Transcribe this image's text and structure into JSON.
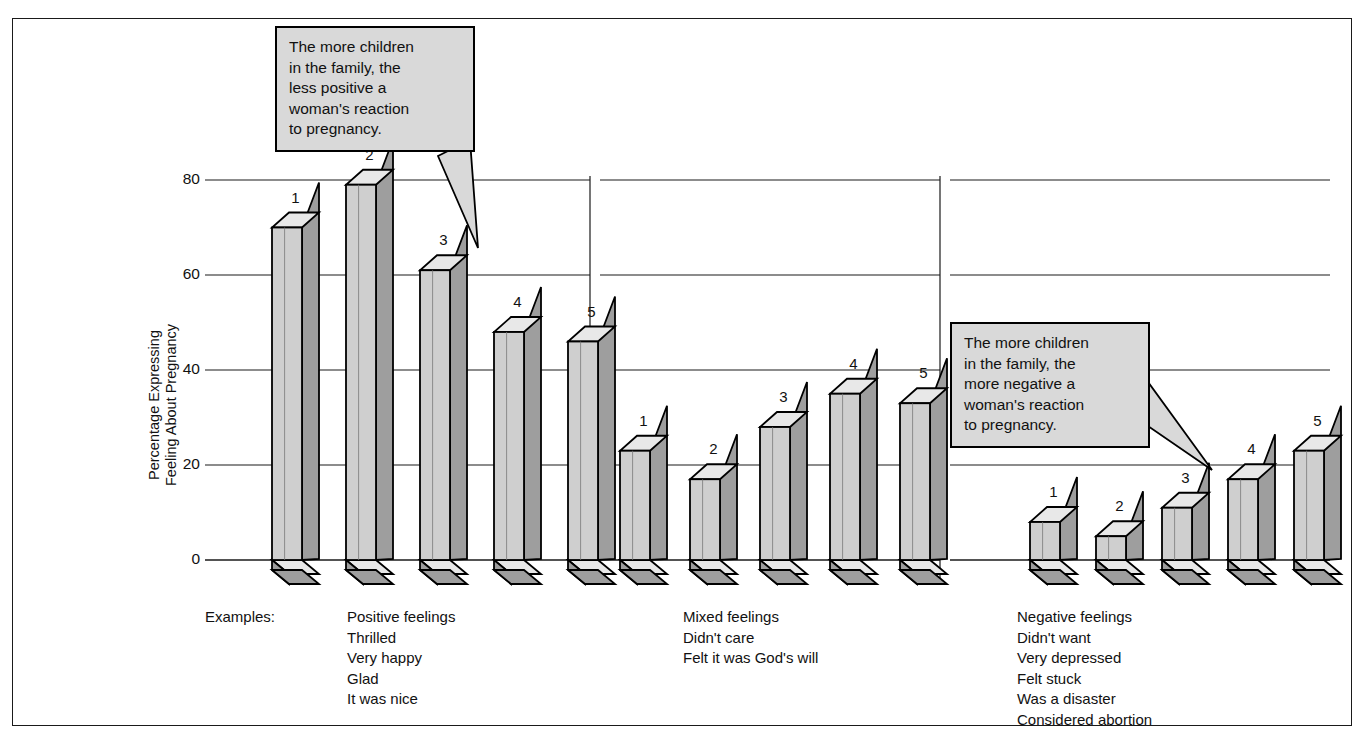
{
  "figure": {
    "examples_label": "Examples:",
    "y_axis_title_line1": "Percentage Expressing",
    "y_axis_title_line2": "Feeling About Pregnancy"
  },
  "callouts": [
    {
      "id": "callout-less-positive",
      "text": "The more children\nin the family, the\nless positive a\nwoman's reaction\nto pregnancy.",
      "fill": "#d9d9d9",
      "border": "#000000"
    },
    {
      "id": "callout-more-negative",
      "text": "The more children\nin the family, the\nmore negative a\nwoman's reaction\nto pregnancy.",
      "fill": "#d9d9d9",
      "border": "#000000"
    }
  ],
  "group_captions": [
    [
      "Positive feelings",
      "Thrilled",
      "Very happy",
      "Glad",
      "It was nice"
    ],
    [
      "Mixed feelings",
      "Didn't care",
      "Felt it was God's will"
    ],
    [
      "Negative feelings",
      "Didn't want",
      "Very depressed",
      "Felt stuck",
      "Was a disaster",
      "Considered abortion"
    ]
  ],
  "colors": {
    "bar_face": "#cfcfcf",
    "bar_side": "#9e9e9e",
    "bar_top": "#e8e8e8",
    "bar_outline": "#000000",
    "gridline": "#1a1a1a",
    "frame": "#1a1a1a"
  },
  "chart_data": {
    "type": "bar",
    "title": "",
    "xlabel": "",
    "ylabel": "Percentage Expressing Feeling About Pregnancy",
    "ylim": [
      0,
      80
    ],
    "yticks": [
      0,
      20,
      40,
      60,
      80
    ],
    "ytick_labels": [
      "0",
      "20",
      "40",
      "60",
      "80"
    ],
    "grid": true,
    "legend": "none",
    "categories": [
      "1",
      "2",
      "3",
      "4",
      "5"
    ],
    "category_meaning": "Number of children in the family",
    "groups": [
      {
        "name": "Positive feelings",
        "bar_labels": [
          "1",
          "2",
          "3",
          "4",
          "5"
        ],
        "values": [
          70,
          79,
          61,
          48,
          46
        ]
      },
      {
        "name": "Mixed feelings",
        "bar_labels": [
          "1",
          "2",
          "3",
          "4",
          "5"
        ],
        "values": [
          23,
          17,
          28,
          35,
          33
        ]
      },
      {
        "name": "Negative feelings",
        "bar_labels": [
          "1",
          "2",
          "3",
          "4",
          "5"
        ],
        "values": [
          8,
          5,
          11,
          17,
          23
        ]
      }
    ]
  }
}
